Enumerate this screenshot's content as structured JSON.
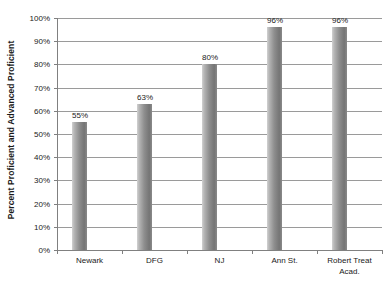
{
  "chart_data": {
    "type": "bar",
    "title": "",
    "xlabel": "",
    "ylabel": "Percent Proficient and Advanced Proficient",
    "categories": [
      "Newark",
      "DFG",
      "NJ",
      "Ann St.",
      "Robert Treat Acad."
    ],
    "category_lines": [
      [
        "Newark"
      ],
      [
        "DFG"
      ],
      [
        "NJ"
      ],
      [
        "Ann St."
      ],
      [
        "Robert Treat",
        "Acad."
      ]
    ],
    "values": [
      55,
      63,
      80,
      96,
      96
    ],
    "data_labels": [
      "55%",
      "63%",
      "80%",
      "96%",
      "96%"
    ],
    "ylim": [
      0,
      100
    ],
    "ytick_values": [
      0,
      10,
      20,
      30,
      40,
      50,
      60,
      70,
      80,
      90,
      100
    ],
    "ytick_labels": [
      "0%",
      "10%",
      "20%",
      "30%",
      "40%",
      "50%",
      "60%",
      "70%",
      "80%",
      "90%",
      "100%"
    ],
    "grid": "horizontal",
    "legend": "none",
    "bar_color": "#8e8e8e",
    "gridline_color": "#9a9a9a",
    "axis_color": "#808080",
    "text_color": "#1a1a1a"
  }
}
